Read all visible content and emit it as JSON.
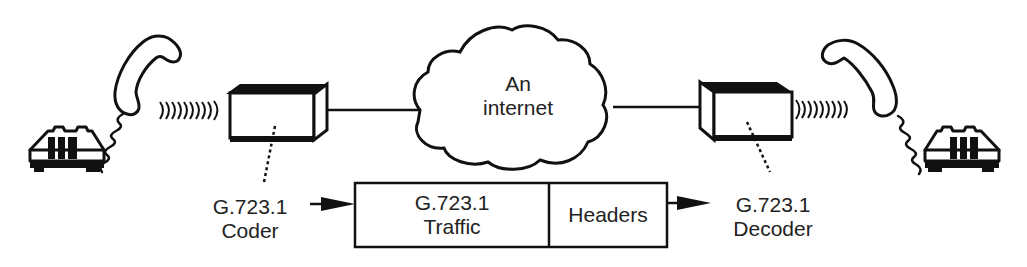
{
  "diagram": {
    "cloud": {
      "line1": "An",
      "line2": "internet"
    },
    "coder": {
      "line1": "G.723.1",
      "line2": "Coder"
    },
    "decoder": {
      "line1": "G.723.1",
      "line2": "Decoder"
    },
    "packet": {
      "payload_line1": "G.723.1",
      "payload_line2": "Traffic",
      "header": "Headers"
    },
    "colors": {
      "stroke": "#111111",
      "background": "#ffffff"
    }
  }
}
